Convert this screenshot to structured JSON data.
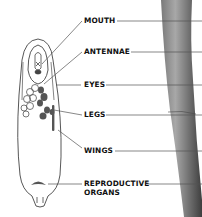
{
  "diagram": {
    "labels": [
      {
        "id": "mouth",
        "text": "MOUTH"
      },
      {
        "id": "antennae",
        "text": "ANTENNAE"
      },
      {
        "id": "eyes",
        "text": "EYES"
      },
      {
        "id": "legs",
        "text": "LEGS"
      },
      {
        "id": "wings",
        "text": "WINGS"
      },
      {
        "id": "reproductive",
        "line1": "REPRODUCTIVE",
        "line2": "ORGANS"
      }
    ],
    "colors": {
      "outline": "#444444",
      "leader_line": "#555555",
      "stem_dark": "#5a5a5a",
      "stem_light": "#9a9a9a",
      "organ_fill": "#555555",
      "text": "#111111"
    }
  }
}
